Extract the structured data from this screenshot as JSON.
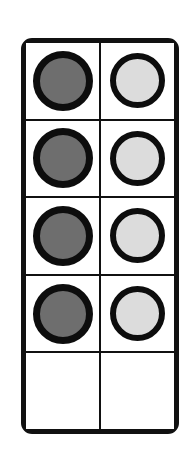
{
  "frame": {
    "name": "ten-frame",
    "columns": 2,
    "rows": 5,
    "border_color": "#111111",
    "background_color": "#ffffff",
    "divider_color": "#111111"
  },
  "counters": {
    "dark": {
      "label": "dark counter",
      "fill_color": "#6e6e6e",
      "ring_color": "#0d0d0d",
      "count": 4
    },
    "light": {
      "label": "light counter",
      "fill_color": "#dcdcdc",
      "ring_color": "#0d0d0d",
      "count": 4
    },
    "empty": {
      "label": "empty space",
      "count": 2
    },
    "total_filled": 8,
    "total_cells": 10
  },
  "grid": [
    [
      {
        "type": "dark",
        "label": "dark counter"
      },
      {
        "type": "light",
        "label": "light counter"
      }
    ],
    [
      {
        "type": "dark",
        "label": "dark counter"
      },
      {
        "type": "light",
        "label": "light counter"
      }
    ],
    [
      {
        "type": "dark",
        "label": "dark counter"
      },
      {
        "type": "light",
        "label": "light counter"
      }
    ],
    [
      {
        "type": "dark",
        "label": "dark counter"
      },
      {
        "type": "light",
        "label": "light counter"
      }
    ],
    [
      {
        "type": "empty",
        "label": "empty space"
      },
      {
        "type": "empty",
        "label": "empty space"
      }
    ]
  ]
}
